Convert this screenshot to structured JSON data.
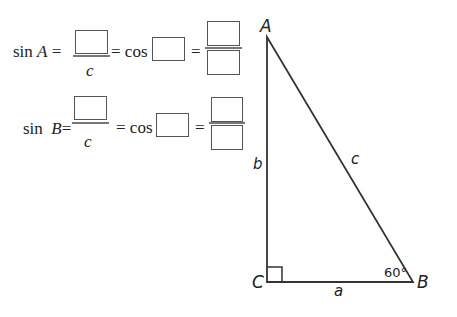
{
  "equations": [
    {
      "lhs": "sin A =",
      "lhs_func": "sin",
      "lhs_angle": "A",
      "denominator": "c",
      "cos_label": "= cos",
      "equals": "="
    },
    {
      "lhs": "sin B =",
      "lhs_func": "sin",
      "lhs_angle": "B",
      "denominator": "c",
      "cos_label": "= cos",
      "equals": "="
    }
  ],
  "triangle": {
    "vertices": {
      "A": "A",
      "B": "B",
      "C": "C"
    },
    "sides": {
      "a": "a",
      "b": "b",
      "c": "c"
    },
    "angle_B": "60°",
    "right_angle_at": "C"
  }
}
